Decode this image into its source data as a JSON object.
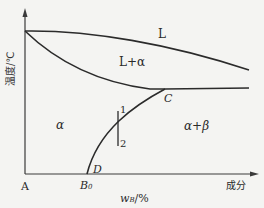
{
  "diagram": {
    "type": "binary-phase-diagram",
    "axes": {
      "y_label": "温度/℃",
      "x_label_symbol": "w",
      "x_label_subscript": "B",
      "x_label_unit": "/%",
      "x_axis_end_label": "成分",
      "origin_label": "A"
    },
    "regions": {
      "liquid": "L",
      "liquid_alpha": "L+α",
      "alpha": "α",
      "alpha_beta": "α+β"
    },
    "points": {
      "C": "C",
      "D": "D",
      "B0_main": "B",
      "B0_sub": "0"
    },
    "line_markers": {
      "top": "1",
      "bottom": "2"
    },
    "colors": {
      "line": "#2b2b2b",
      "background": "#f4f4f2",
      "text": "#2a2a2a"
    }
  }
}
